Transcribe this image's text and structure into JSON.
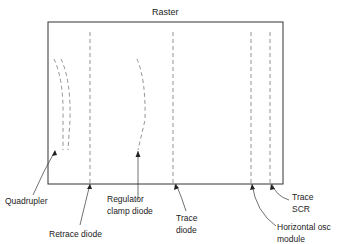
{
  "title": "Raster",
  "labels": {
    "quadrupler": "Quadrupler",
    "retrace_diode": "Retrace diode",
    "regulator_clamp_diode_1": "Regulator",
    "regulator_clamp_diode_2": "clamp diode",
    "trace_diode_1": "Trace",
    "trace_diode_2": "diode",
    "horizontal_osc_module_1": "Horizontal osc",
    "horizontal_osc_module_2": "module",
    "trace_scr_1": "Trace",
    "trace_scr_2": "SCR"
  }
}
